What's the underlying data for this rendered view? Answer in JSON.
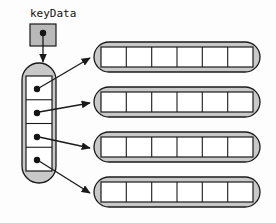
{
  "diagram": {
    "background_color": "#fdfdfd",
    "stroke_color": "#1a1a1a",
    "fill_gray": "#c9c9c9",
    "fill_white": "#ffffff",
    "dot_color": "#141414"
  },
  "variable": {
    "label": "keyData",
    "icon": "pointer-dot",
    "box": {
      "x": 30,
      "y": 24,
      "w": 26,
      "h": 22,
      "fill": "#b9b9b9"
    },
    "dot": {
      "cx": 43,
      "cy": 33,
      "r": 3.2
    },
    "arrow": {
      "x1": 43,
      "y1": 36,
      "x2": 43,
      "y2": 63
    }
  },
  "pointer_array": {
    "name": "vertical-pointer-array",
    "cell_count": 4,
    "capsule": {
      "x": 22,
      "y": 63,
      "w": 34,
      "h": 120,
      "rx": 17,
      "fill": "#c9c9c9"
    },
    "inner": {
      "x": 26,
      "y": 76,
      "w": 26,
      "h": 95,
      "fill": "#ffffff"
    },
    "cells": [
      {
        "index": 0,
        "dot_cx": 36,
        "dot_cy": 89,
        "value": "pointer"
      },
      {
        "index": 1,
        "dot_cx": 36,
        "dot_cy": 113,
        "value": "pointer"
      },
      {
        "index": 2,
        "dot_cx": 36,
        "dot_cy": 137,
        "value": "pointer"
      },
      {
        "index": 3,
        "dot_cx": 36,
        "dot_cy": 160,
        "value": "pointer"
      }
    ]
  },
  "data_arrays": [
    {
      "index": 0,
      "name": "data-array-0",
      "cell_count": 6,
      "capsule": {
        "x": 94,
        "y": 42,
        "w": 166,
        "h": 30,
        "rx": 15,
        "fill": "#c9c9c9"
      },
      "inner": {
        "x": 101,
        "y": 47,
        "w": 152,
        "h": 20,
        "fill": "#ffffff"
      },
      "cells": [
        "",
        "",
        "",
        "",
        "",
        ""
      ]
    },
    {
      "index": 1,
      "name": "data-array-1",
      "cell_count": 6,
      "capsule": {
        "x": 94,
        "y": 87,
        "w": 166,
        "h": 30,
        "rx": 15,
        "fill": "#c9c9c9"
      },
      "inner": {
        "x": 101,
        "y": 92,
        "w": 152,
        "h": 20,
        "fill": "#ffffff"
      },
      "cells": [
        "",
        "",
        "",
        "",
        "",
        ""
      ]
    },
    {
      "index": 2,
      "name": "data-array-2",
      "cell_count": 6,
      "capsule": {
        "x": 94,
        "y": 132,
        "w": 166,
        "h": 30,
        "rx": 15,
        "fill": "#c9c9c9"
      },
      "inner": {
        "x": 101,
        "y": 137,
        "w": 152,
        "h": 20,
        "fill": "#ffffff"
      },
      "cells": [
        "",
        "",
        "",
        "",
        "",
        ""
      ]
    },
    {
      "index": 3,
      "name": "data-array-3",
      "cell_count": 6,
      "capsule": {
        "x": 94,
        "y": 177,
        "w": 166,
        "h": 30,
        "rx": 15,
        "fill": "#c9c9c9"
      },
      "inner": {
        "x": 101,
        "y": 182,
        "w": 152,
        "h": 20,
        "fill": "#ffffff"
      },
      "cells": [
        "",
        "",
        "",
        "",
        "",
        ""
      ]
    }
  ],
  "connectors": [
    {
      "name": "connector-0",
      "from_cell": 0,
      "to_array": 0,
      "x1": 38,
      "y1": 89,
      "x2": 90,
      "y2": 58
    },
    {
      "name": "connector-1",
      "from_cell": 1,
      "to_array": 1,
      "x1": 38,
      "y1": 113,
      "x2": 90,
      "y2": 103
    },
    {
      "name": "connector-2",
      "from_cell": 2,
      "to_array": 2,
      "x1": 38,
      "y1": 137,
      "x2": 90,
      "y2": 148
    },
    {
      "name": "connector-3",
      "from_cell": 3,
      "to_array": 3,
      "x1": 38,
      "y1": 160,
      "x2": 90,
      "y2": 193
    }
  ]
}
